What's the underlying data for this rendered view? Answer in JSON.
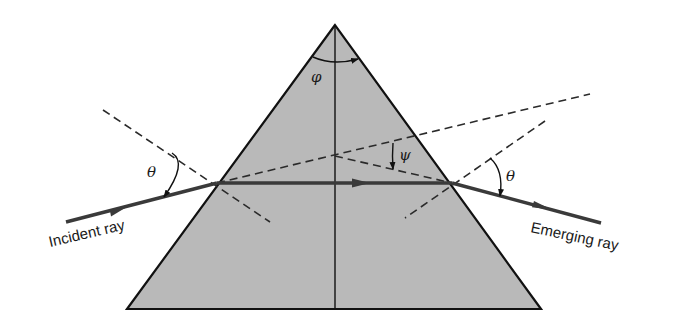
{
  "diagram": {
    "colors": {
      "background": "#ffffff",
      "prism_fill": "#b9b9b9",
      "outline": "#111111",
      "ray": "#3a3a3a",
      "dashed": "#2a2a2a"
    },
    "prism": {
      "apex": [
        335,
        25
      ],
      "bottom_left": [
        127,
        309
      ],
      "bottom_right": [
        541,
        309
      ]
    },
    "labels": {
      "incident_ray": "Incident ray",
      "emerging_ray": "Emerging ray",
      "angle_theta_left": "θ",
      "angle_theta_right": "θ",
      "angle_phi": "φ",
      "angle_psi": "ψ"
    },
    "rays": {
      "incident": {
        "from": [
          66,
          222
        ],
        "to": [
          217,
          183
        ]
      },
      "internal": {
        "from": [
          217,
          183
        ],
        "to": [
          452,
          183
        ]
      },
      "emerging": {
        "from": [
          452,
          183
        ],
        "to": [
          601,
          223
        ]
      }
    },
    "dashed_lines": {
      "left_normal": {
        "from": [
          103,
          110
        ],
        "to": [
          270,
          222
        ]
      },
      "right_normal": {
        "from": [
          545,
          121
        ],
        "to": [
          405,
          218
        ]
      },
      "incident_extension": {
        "from": [
          217,
          183
        ],
        "to": [
          590,
          94
        ]
      },
      "emerging_back_extension": {
        "from": [
          335,
          156
        ],
        "to": [
          452,
          183
        ]
      }
    }
  }
}
